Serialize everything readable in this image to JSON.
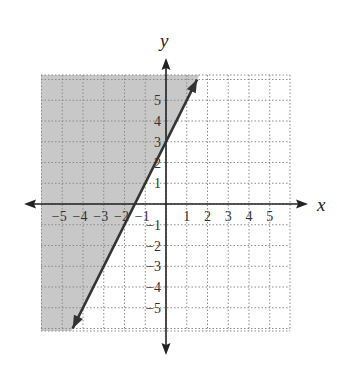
{
  "chart_data": {
    "type": "inequality-graph",
    "title": "",
    "xlabel": "x",
    "ylabel": "y",
    "xlim": [
      -6,
      6
    ],
    "ylim": [
      -6,
      6
    ],
    "grid": true,
    "grid_style": "dotted",
    "x_tick_labels": [
      "−5",
      "−4",
      "−3",
      "−2",
      "−1",
      "1",
      "2",
      "3",
      "4",
      "5"
    ],
    "x_ticks": [
      -5,
      -4,
      -3,
      -2,
      -1,
      1,
      2,
      3,
      4,
      5
    ],
    "y_tick_labels": [
      "5",
      "4",
      "3",
      "2",
      "1",
      "−1",
      "−2",
      "−3",
      "−4",
      "−5"
    ],
    "y_ticks": [
      5,
      4,
      3,
      2,
      1,
      -1,
      -2,
      -3,
      -4,
      -5
    ],
    "boundary_line": {
      "equation": "y = 2x + 3",
      "slope": 2,
      "intercept": 3,
      "style": "solid",
      "points": [
        [
          -4.5,
          -6
        ],
        [
          1.5,
          6
        ]
      ]
    },
    "inequality": "y ≥ 2x + 3",
    "shaded_region": "left/above boundary line",
    "colors": {
      "shade": "#c8c8c8",
      "line": "#333333",
      "axis": "#222222",
      "grid": "#8a8a8a"
    }
  }
}
